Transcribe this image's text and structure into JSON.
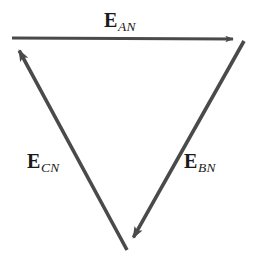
{
  "figure": {
    "kind": "phasor-diagram",
    "background_color": "#ffffff",
    "stroke_color": "#4a4a4a",
    "text_color": "#1a1a1a",
    "width": 257,
    "height": 267
  },
  "chart_data": {
    "type": "diagram",
    "title": "",
    "xlabel": "",
    "ylabel": "",
    "grid": false,
    "legend": "none",
    "vectors": [
      {
        "id": "EAN",
        "symbol": "E",
        "subscript": "AN",
        "label": "E_AN",
        "from": [
          12,
          38
        ],
        "to": [
          241,
          39
        ],
        "arrow_at": "to",
        "orientation": "horizontal-right"
      },
      {
        "id": "EBN",
        "symbol": "E",
        "subscript": "BN",
        "label": "E_BN",
        "from": [
          244,
          41
        ],
        "to": [
          128,
          247
        ],
        "arrow_at": "to",
        "orientation": "down-left"
      },
      {
        "id": "ECN",
        "symbol": "E",
        "subscript": "CN",
        "label": "E_CN",
        "from": [
          127,
          250
        ],
        "to": [
          14,
          41
        ],
        "arrow_at": "to",
        "orientation": "up-left"
      }
    ]
  },
  "labels": {
    "an": {
      "symbol": "E",
      "subscript": "AN"
    },
    "cn": {
      "symbol": "E",
      "subscript": "CN"
    },
    "bn": {
      "symbol": "E",
      "subscript": "BN"
    }
  }
}
